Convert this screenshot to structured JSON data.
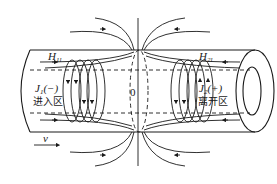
{
  "diagram": {
    "labels": {
      "h11": {
        "main": "H",
        "sub": "1l"
      },
      "h21": {
        "main": "H",
        "sub": "2l"
      },
      "j1": {
        "main": "J",
        "sub": "1",
        "sign": "(−)"
      },
      "j2": {
        "main": "J",
        "sub": "2",
        "sign": "(+)"
      },
      "entry_zone": "进入区",
      "exit_zone": "离开区",
      "center": "0",
      "velocity": "v"
    },
    "colors": {
      "line": "#1a1a1a",
      "background": "#ffffff"
    }
  }
}
